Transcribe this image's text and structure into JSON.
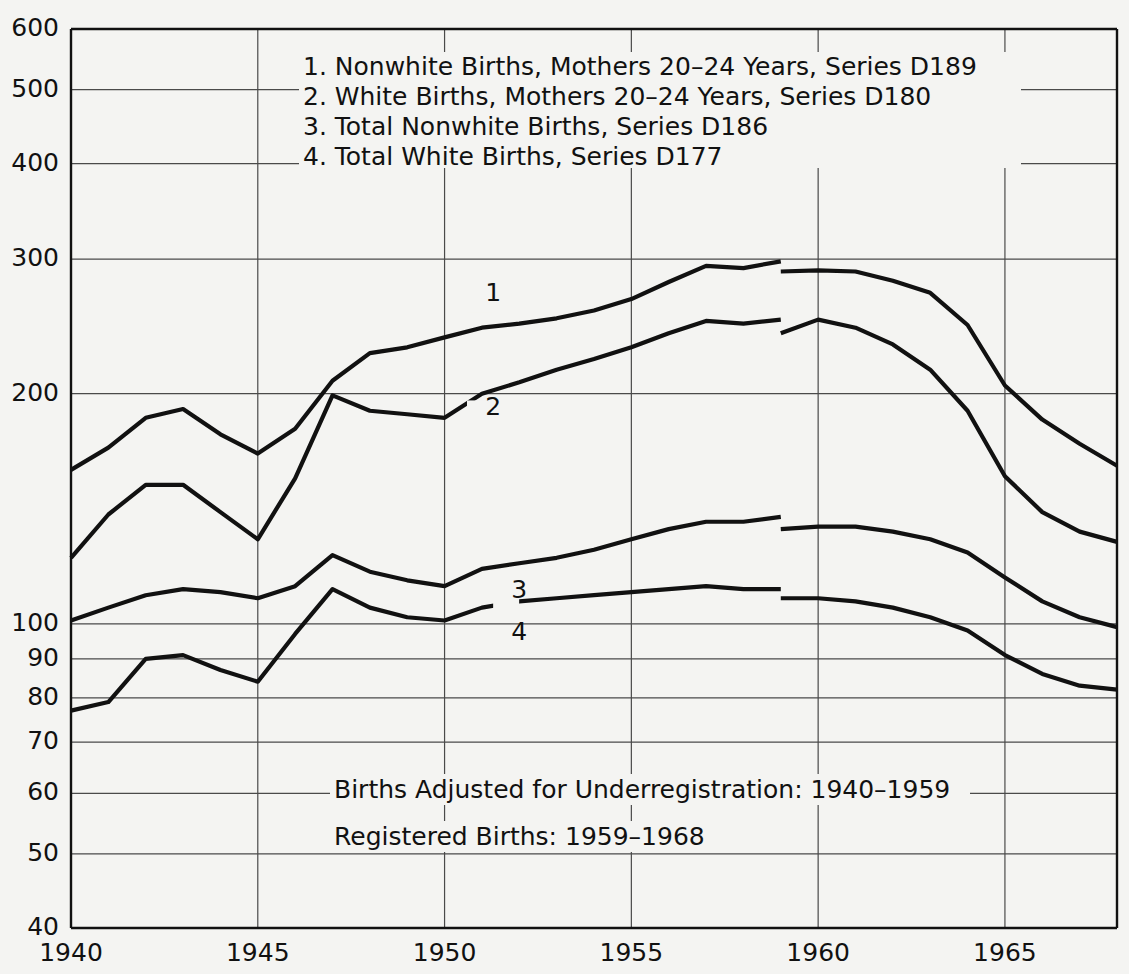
{
  "chart_data": {
    "type": "line",
    "title": "",
    "xlabel": "",
    "ylabel": "",
    "scale": "log",
    "grid": true,
    "legend_position": "inside-top-center",
    "xlim": [
      1940,
      1968
    ],
    "ylim": [
      40,
      600
    ],
    "xticks": [
      1940,
      1945,
      1950,
      1955,
      1960,
      1965
    ],
    "xtick_labels": [
      "1940",
      "1945",
      "1950",
      "1955",
      "1960",
      "1965"
    ],
    "yticks": [
      40,
      50,
      60,
      70,
      80,
      90,
      100,
      200,
      300,
      400,
      500,
      600
    ],
    "ytick_labels": [
      "40",
      "50",
      "60",
      "70",
      "80",
      "90",
      "100",
      "200",
      "300",
      "400",
      "500",
      "600"
    ],
    "legend": [
      "1. Nonwhite Births, Mothers 20–24 Years, Series D189",
      "2. White Births, Mothers 20–24 Years, Series D180",
      "3. Total Nonwhite Births, Series D186",
      "4. Total White Births, Series D177"
    ],
    "annotations": [
      "Births Adjusted for Underregistration: 1940–1959",
      "Registered Births: 1959–1968"
    ],
    "series_labels": [
      "1",
      "2",
      "3",
      "4"
    ],
    "series": [
      {
        "name": "1. Nonwhite Births, Mothers 20–24 Years, Series D189",
        "label": "1",
        "segments": [
          {
            "kind": "adjusted",
            "x": [
              1940,
              1941,
              1942,
              1943,
              1944,
              1945,
              1946,
              1947,
              1948,
              1949,
              1950,
              1951,
              1952,
              1953,
              1954,
              1955,
              1956,
              1957,
              1958,
              1959
            ],
            "y": [
              159,
              170,
              186,
              191,
              177,
              167,
              180,
              208,
              226,
              230,
              237,
              244,
              247,
              251,
              257,
              266,
              280,
              294,
              292,
              298
            ]
          },
          {
            "kind": "registered",
            "x": [
              1959,
              1960,
              1961,
              1962,
              1963,
              1964,
              1965,
              1966,
              1967,
              1968
            ],
            "y": [
              289,
              290,
              289,
              281,
              271,
              246,
              205,
              185,
              172,
              161
            ]
          }
        ]
      },
      {
        "name": "2. White Births, Mothers 20–24 Years, Series D180",
        "label": "2",
        "segments": [
          {
            "kind": "adjusted",
            "x": [
              1940,
              1941,
              1942,
              1943,
              1944,
              1945,
              1946,
              1947,
              1948,
              1949,
              1950,
              1951,
              1952,
              1953,
              1954,
              1955,
              1956,
              1957,
              1958,
              1959
            ],
            "y": [
              122,
              139,
              152,
              152,
              140,
              129,
              155,
              199,
              190,
              188,
              186,
              200,
              207,
              215,
              222,
              230,
              240,
              249,
              247,
              250
            ]
          },
          {
            "kind": "registered",
            "x": [
              1959,
              1960,
              1961,
              1962,
              1963,
              1964,
              1965,
              1966,
              1967,
              1968
            ],
            "y": [
              240,
              250,
              244,
              232,
              215,
              190,
              156,
              140,
              132,
              128
            ]
          }
        ]
      },
      {
        "name": "3. Total Nonwhite Births, Series D186",
        "label": "3",
        "segments": [
          {
            "kind": "adjusted",
            "x": [
              1940,
              1941,
              1942,
              1943,
              1944,
              1945,
              1946,
              1947,
              1948,
              1949,
              1950,
              1951,
              1952,
              1953,
              1954,
              1955,
              1956,
              1957,
              1958,
              1959
            ],
            "y": [
              101,
              105,
              109,
              111,
              110,
              108,
              112,
              123,
              117,
              114,
              112,
              118,
              120,
              122,
              125,
              129,
              133,
              136,
              136,
              138
            ]
          },
          {
            "kind": "registered",
            "x": [
              1959,
              1960,
              1961,
              1962,
              1963,
              1964,
              1965,
              1966,
              1967,
              1968
            ],
            "y": [
              133,
              134,
              134,
              132,
              129,
              124,
              115,
              107,
              102,
              99
            ]
          }
        ]
      },
      {
        "name": "4. Total White Births, Series D177",
        "label": "4",
        "segments": [
          {
            "kind": "adjusted",
            "x": [
              1940,
              1941,
              1942,
              1943,
              1944,
              1945,
              1946,
              1947,
              1948,
              1949,
              1950,
              1951,
              1952,
              1953,
              1954,
              1955,
              1956,
              1957,
              1958,
              1959
            ],
            "y": [
              77,
              79,
              90,
              91,
              87,
              84,
              97,
              111,
              105,
              102,
              101,
              105,
              107,
              108,
              109,
              110,
              111,
              112,
              111,
              111
            ]
          },
          {
            "kind": "registered",
            "x": [
              1959,
              1960,
              1961,
              1962,
              1963,
              1964,
              1965,
              1966,
              1967,
              1968
            ],
            "y": [
              108,
              108,
              107,
              105,
              102,
              98,
              91,
              86,
              83,
              82
            ]
          }
        ]
      }
    ]
  },
  "legend_block": {
    "items": [
      "1. Nonwhite Births, Mothers 20–24 Years, Series D189",
      "2. White Births, Mothers 20–24 Years, Series D180",
      "3. Total Nonwhite Births, Series D186",
      "4. Total White Births, Series D177"
    ]
  },
  "notes_block": {
    "items": [
      "Births Adjusted for Underregistration: 1940–1959",
      "Registered Births: 1959–1968"
    ]
  }
}
